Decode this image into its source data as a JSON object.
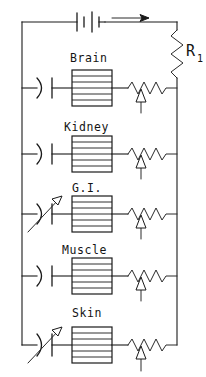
{
  "diagram": {
    "type": "schematic",
    "ink_color": "#1a1a1a",
    "background_color": "#ffffff"
  },
  "source": {
    "name": "battery-symbol",
    "label": "",
    "cells": 2,
    "current_arrow": {
      "name": "current-direction-arrow",
      "label": "",
      "direction": "right"
    }
  },
  "series_resistor": {
    "name": "R1",
    "label_main": "R",
    "label_sub": "1",
    "style": "zigzag",
    "position": "right-rail"
  },
  "branches": [
    {
      "id": "brain",
      "label": "Brain",
      "capacitor": {
        "type": "fixed",
        "variable": false
      },
      "compartment": {
        "type": "hatched-box",
        "bands": 6
      },
      "resistor": {
        "type": "variable",
        "wiper": "up-arrow"
      }
    },
    {
      "id": "kidney",
      "label": "Kidney",
      "capacitor": {
        "type": "fixed",
        "variable": false
      },
      "compartment": {
        "type": "hatched-box",
        "bands": 6
      },
      "resistor": {
        "type": "variable",
        "wiper": "up-arrow"
      }
    },
    {
      "id": "gi",
      "label": "G.I.",
      "capacitor": {
        "type": "variable",
        "variable": true
      },
      "compartment": {
        "type": "hatched-box",
        "bands": 6
      },
      "resistor": {
        "type": "variable",
        "wiper": "up-arrow"
      }
    },
    {
      "id": "muscle",
      "label": "Muscle",
      "capacitor": {
        "type": "fixed",
        "variable": false
      },
      "compartment": {
        "type": "hatched-box",
        "bands": 6
      },
      "resistor": {
        "type": "variable",
        "wiper": "up-arrow"
      }
    },
    {
      "id": "skin",
      "label": "Skin",
      "capacitor": {
        "type": "variable",
        "variable": true
      },
      "compartment": {
        "type": "hatched-box",
        "bands": 6
      },
      "resistor": {
        "type": "variable",
        "wiper": "up-arrow"
      }
    }
  ]
}
